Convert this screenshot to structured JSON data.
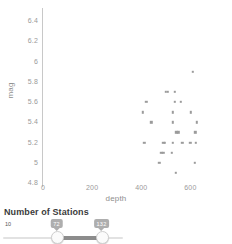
{
  "chart_data": {
    "type": "scatter",
    "title": "",
    "xlabel": "depth",
    "ylabel": "mag",
    "xlim": [
      0,
      700
    ],
    "ylim": [
      4.8,
      6.5
    ],
    "xticks": [
      0,
      200,
      400,
      600
    ],
    "xtick_labels": [
      "0",
      "200",
      "400",
      "600"
    ],
    "yticks": [
      4.8,
      5,
      5.2,
      5.4,
      5.6,
      5.8,
      6,
      6.2,
      6.4
    ],
    "ytick_labels": [
      "4.8",
      "5",
      "5.2",
      "5.4",
      "5.6",
      "5.8",
      "6",
      "6.2",
      "6.4"
    ],
    "grid": false,
    "legend": false,
    "marker_color": "#9b9b9b",
    "points": [
      {
        "depth": 610,
        "mag": 5.9
      },
      {
        "depth": 500,
        "mag": 5.7
      },
      {
        "depth": 508,
        "mag": 5.7
      },
      {
        "depth": 537,
        "mag": 5.7
      },
      {
        "depth": 420,
        "mag": 5.6
      },
      {
        "depth": 536,
        "mag": 5.6
      },
      {
        "depth": 560,
        "mag": 5.6
      },
      {
        "depth": 405,
        "mag": 5.5
      },
      {
        "depth": 528,
        "mag": 5.5
      },
      {
        "depth": 602,
        "mag": 5.5
      },
      {
        "depth": 440,
        "mag": 5.4
      },
      {
        "depth": 528,
        "mag": 5.4
      },
      {
        "depth": 627,
        "mag": 5.4
      },
      {
        "depth": 542,
        "mag": 5.3
      },
      {
        "depth": 551,
        "mag": 5.3
      },
      {
        "depth": 620,
        "mag": 5.3
      },
      {
        "depth": 413,
        "mag": 5.2
      },
      {
        "depth": 489,
        "mag": 5.2
      },
      {
        "depth": 496,
        "mag": 5.2
      },
      {
        "depth": 528,
        "mag": 5.2
      },
      {
        "depth": 567,
        "mag": 5.2
      },
      {
        "depth": 600,
        "mag": 5.2
      },
      {
        "depth": 622,
        "mag": 5.2
      },
      {
        "depth": 481,
        "mag": 5.1
      },
      {
        "depth": 489,
        "mag": 5.1
      },
      {
        "depth": 525,
        "mag": 5.1
      },
      {
        "depth": 474,
        "mag": 5.0
      },
      {
        "depth": 618,
        "mag": 5.0
      },
      {
        "depth": 540,
        "mag": 4.9
      }
    ]
  },
  "chart": {
    "axis_x_title": "depth",
    "axis_y_title": "mag"
  },
  "control": {
    "title": "Number of Stations",
    "min_label": "10",
    "low_value": "72",
    "high_value": "132"
  }
}
